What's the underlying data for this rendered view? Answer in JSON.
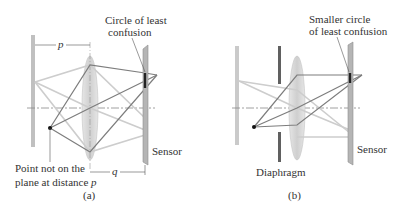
{
  "panel_a": {
    "caption": "(a)",
    "labels": {
      "circle_line1": "Circle of least",
      "circle_line2": "confusion",
      "p": "p",
      "q": "q",
      "sensor": "Sensor",
      "point_line1": "Point not on the",
      "point_line2": "plane at distance ",
      "point_line2_var": "p"
    }
  },
  "panel_b": {
    "caption": "(b)",
    "labels": {
      "circle_line1": "Smaller circle",
      "circle_line2": "of least confusion",
      "sensor": "Sensor",
      "diaphragm": "Diaphragm"
    }
  },
  "colors": {
    "ray_dark": "#7a7a7a",
    "ray_light": "#c8c8c8",
    "lens_fill": "#d9d9d9",
    "sensor_fill": "#b5b5b5",
    "diaphragm": "#606060",
    "text": "#333333"
  }
}
